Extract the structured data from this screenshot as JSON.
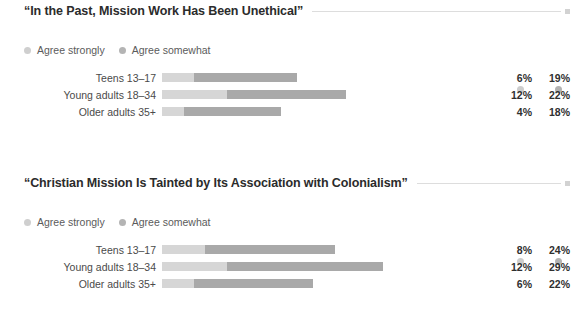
{
  "chart_data": [
    {
      "type": "bar",
      "title": "“In the Past, Mission Work Has Been Unethical”",
      "subtype": "stacked-horizontal",
      "xlabel": "",
      "ylabel": "",
      "xlim": [
        0,
        100
      ],
      "grid": false,
      "legend_position": "top-left",
      "categories": [
        "Teens 13–17",
        "Young adults 18–34",
        "Older adults 35+"
      ],
      "series": [
        {
          "name": "Agree strongly",
          "values": [
            6,
            12,
            4
          ],
          "color": "#d6d6d6"
        },
        {
          "name": "Agree somewhat",
          "values": [
            19,
            22,
            18
          ],
          "color": "#a9a9a9"
        }
      ],
      "rows": [
        {
          "label": "Teens 13–17",
          "strong": 6,
          "somewhat": 19,
          "strong_label": "6%",
          "somewhat_label": "19%"
        },
        {
          "label": "Young adults 18–34",
          "strong": 12,
          "somewhat": 22,
          "strong_label": "12%",
          "somewhat_label": "22%"
        },
        {
          "label": "Older adults 35+",
          "strong": 4,
          "somewhat": 18,
          "strong_label": "4%",
          "somewhat_label": "18%"
        }
      ]
    },
    {
      "type": "bar",
      "title": "“Christian Mission Is Tainted by Its Association with Colonialism”",
      "subtype": "stacked-horizontal",
      "xlabel": "",
      "ylabel": "",
      "xlim": [
        0,
        100
      ],
      "grid": false,
      "legend_position": "top-left",
      "categories": [
        "Teens 13–17",
        "Young adults 18–34",
        "Older adults 35+"
      ],
      "series": [
        {
          "name": "Agree strongly",
          "values": [
            8,
            12,
            6
          ],
          "color": "#d6d6d6"
        },
        {
          "name": "Agree somewhat",
          "values": [
            24,
            29,
            22
          ],
          "color": "#a9a9a9"
        }
      ],
      "rows": [
        {
          "label": "Teens 13–17",
          "strong": 8,
          "somewhat": 24,
          "strong_label": "8%",
          "somewhat_label": "24%"
        },
        {
          "label": "Young adults 18–34",
          "strong": 12,
          "somewhat": 29,
          "strong_label": "12%",
          "somewhat_label": "29%"
        },
        {
          "label": "Older adults 35+",
          "strong": 6,
          "somewhat": 22,
          "strong_label": "6%",
          "somewhat_label": "22%"
        }
      ]
    }
  ],
  "colors": {
    "agree_strongly": "#d6d6d6",
    "agree_somewhat": "#a9a9a9",
    "legend_dot_strongly": "#cfcfcf",
    "legend_dot_somewhat": "#b4b4b4",
    "title_rule": "#dddddd",
    "title_text": "#2b2b2b",
    "label_text": "#4a4a4a",
    "value_text": "#2f2f2f",
    "background": "#ffffff"
  },
  "scale": {
    "pixels_per_percent": 5.4,
    "bar_origin_x": 168
  }
}
